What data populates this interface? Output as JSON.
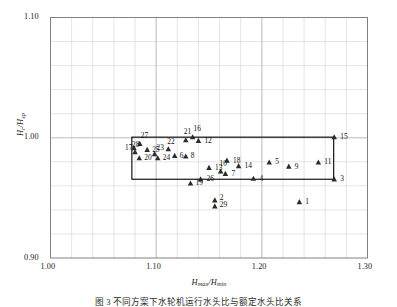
{
  "figure": {
    "caption": "图 3   不同方案下水轮机运行水头比与额定水头比关系",
    "background_color": "#ffffff",
    "frame_color": "#808080",
    "grid_color": "#d9d9d9",
    "marker_color": "#2b2b2b",
    "overlay_color": "#000000"
  },
  "chart_data": {
    "type": "scatter",
    "title": "",
    "xlabel": "Hmax/Hmin",
    "ylabel": "Hr/Hsp",
    "xlabel_parts": {
      "main1": "H",
      "sub1": "max",
      "slash": "/",
      "main2": "H",
      "sub2": "min"
    },
    "ylabel_parts": {
      "main1": "H",
      "sub1": "r",
      "slash": "/",
      "main2": "H",
      "sub2": "sp"
    },
    "xlim": [
      1.0,
      1.3
    ],
    "ylim": [
      0.9,
      1.1
    ],
    "x_major_ticks": [
      1.0,
      1.1,
      1.2,
      1.3
    ],
    "x_major_tick_labels": [
      "1.00",
      "1.10",
      "1.20",
      "1.30"
    ],
    "y_major_ticks": [
      0.9,
      1.0,
      1.1
    ],
    "y_major_tick_labels": [
      "0.90",
      "1.00",
      "1.10"
    ],
    "x_minor_step": 0.02,
    "y_minor_step": 0.02,
    "grid": true,
    "legend": "none",
    "marker": "triangle-up",
    "overlay_rectangle": {
      "x_min": 1.077,
      "x_max": 1.268,
      "y_min": 0.9655,
      "y_max": 1.0005,
      "stroke": "#000000",
      "fill": "none",
      "stroke_width": 1.1
    },
    "points": [
      {
        "label": "1",
        "x": 1.2355,
        "y": 0.9465,
        "lx": 6,
        "ly": -2
      },
      {
        "label": "2",
        "x": 1.1555,
        "y": 0.948,
        "lx": 5,
        "ly": -4
      },
      {
        "label": "3",
        "x": 1.2685,
        "y": 0.9655,
        "lx": 6,
        "ly": -2
      },
      {
        "label": "4",
        "x": 1.192,
        "y": 0.966,
        "lx": 6,
        "ly": -2
      },
      {
        "label": "5",
        "x": 1.207,
        "y": 0.9795,
        "lx": 6,
        "ly": -2
      },
      {
        "label": "6",
        "x": 1.1175,
        "y": 0.985,
        "lx": 5,
        "ly": -2
      },
      {
        "label": "7",
        "x": 1.1655,
        "y": 0.97,
        "lx": 6,
        "ly": -2
      },
      {
        "label": "8",
        "x": 1.128,
        "y": 0.9845,
        "lx": 5,
        "ly": -2
      },
      {
        "label": "9",
        "x": 1.2255,
        "y": 0.976,
        "lx": 6,
        "ly": -2
      },
      {
        "label": "10",
        "x": 1.161,
        "y": 0.972,
        "lx": -1,
        "ly": -9
      },
      {
        "label": "11",
        "x": 1.2535,
        "y": 0.9795,
        "lx": 6,
        "ly": -2
      },
      {
        "label": "12",
        "x": 1.14,
        "y": 0.9975,
        "lx": 6,
        "ly": -2
      },
      {
        "label": "13",
        "x": 1.15,
        "y": 0.975,
        "lx": 6,
        "ly": -2
      },
      {
        "label": "14",
        "x": 1.178,
        "y": 0.9765,
        "lx": 6,
        "ly": -2
      },
      {
        "label": "15",
        "x": 1.2685,
        "y": 1.0005,
        "lx": 6,
        "ly": -2
      },
      {
        "label": "16",
        "x": 1.1345,
        "y": 1.0005,
        "lx": 1,
        "ly": -10
      },
      {
        "label": "17",
        "x": 1.079,
        "y": 0.9915,
        "lx": -9,
        "ly": -2
      },
      {
        "label": "18",
        "x": 1.167,
        "y": 0.981,
        "lx": 6,
        "ly": -2
      },
      {
        "label": "19",
        "x": 1.1325,
        "y": 0.962,
        "lx": 5,
        "ly": -2
      },
      {
        "label": "20",
        "x": 1.084,
        "y": 0.983,
        "lx": 5,
        "ly": -2
      },
      {
        "label": "21",
        "x": 1.128,
        "y": 0.998,
        "lx": -2,
        "ly": -10
      },
      {
        "label": "22",
        "x": 1.1115,
        "y": 0.9905,
        "lx": -1,
        "ly": -9
      },
      {
        "label": "23",
        "x": 1.0985,
        "y": 0.9865,
        "lx": 2,
        "ly": -8
      },
      {
        "label": "24",
        "x": 1.1015,
        "y": 0.983,
        "lx": 5,
        "ly": -2
      },
      {
        "label": "25",
        "x": 1.0915,
        "y": 0.99,
        "lx": 5,
        "ly": -2
      },
      {
        "label": "26",
        "x": 1.142,
        "y": 0.9655,
        "lx": 6,
        "ly": -2
      },
      {
        "label": "27",
        "x": 1.0845,
        "y": 0.995,
        "lx": 1,
        "ly": -10
      },
      {
        "label": "28",
        "x": 1.08,
        "y": 0.988,
        "lx": -3,
        "ly": -9
      },
      {
        "label": "29",
        "x": 1.1555,
        "y": 0.943,
        "lx": 5,
        "ly": -3
      }
    ]
  }
}
